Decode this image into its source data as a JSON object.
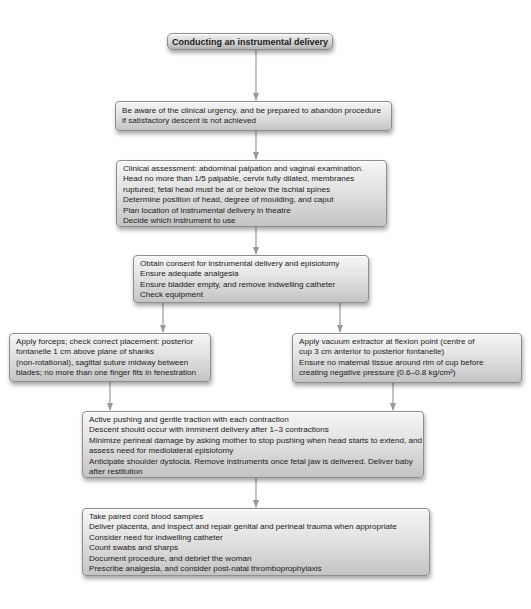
{
  "diagram": {
    "title": "Conducting an instrumental delivery",
    "steps": {
      "awareness": {
        "lines": [
          "Be aware of the clinical urgency, and be prepared to abandon procedure",
          "if satisfactory descent is not achieved"
        ]
      },
      "assessment": {
        "lines": [
          "Clinical assessment: abdominal palpation and vaginal examination.",
          "Head no more than 1/5 palpable, cervix fully dilated, membranes",
          "ruptured; fetal head must be at or below the ischial spines",
          "Determine position of head, degree of moulding, and caput",
          "Plan location of instrumental delivery in theatre",
          "Decide which instrument to use"
        ]
      },
      "consent": {
        "lines": [
          "Obtain consent for instrumental delivery and episiotomy",
          "Ensure adequate analgesia",
          "Ensure bladder empty, and remove indwelling catheter",
          "Check equipment"
        ]
      },
      "forceps": {
        "lines": [
          "Apply forceps; check correct placement: posterior",
          "fontanelle 1 cm above plane of shanks",
          "(non-rotational), sagittal suture midway between",
          "blades; no more than one finger fits in fenestration"
        ]
      },
      "vacuum": {
        "lines": [
          "Apply vacuum extractor at flexion point (centre of",
          "cup 3 cm anterior to posterior fontanelle)",
          "Ensure no maternal tissue around rim of cup before",
          "creating negative pressure (0.6–0.8 kg/cm²)"
        ]
      },
      "pushing": {
        "lines": [
          "Active pushing and gentle traction with each contraction",
          "Descent should occur with imminent delivery after 1–3 contractions",
          "Minimize perineal damage by asking mother to stop pushing when head starts to extend, and",
          "assess need for mediolateral episiotomy",
          "Anticipate shoulder dystocia. Remove instruments once fetal jaw is delivered. Deliver baby",
          "after restitution"
        ]
      },
      "aftercare": {
        "lines": [
          "Take paired cord blood samples",
          "Deliver placenta, and inspect and repair genital and perineal trauma when appropriate",
          "Consider need for indwelling catheter",
          "Count swabs and sharps",
          "Document procedure, and debrief the woman",
          "Prescribe analgesia, and consider post-natal thromboprophylaxis"
        ]
      }
    },
    "colors": {
      "connector": "#9a9a9a",
      "box_border": "#8e8e8e",
      "text": "#1a1a1a"
    }
  }
}
